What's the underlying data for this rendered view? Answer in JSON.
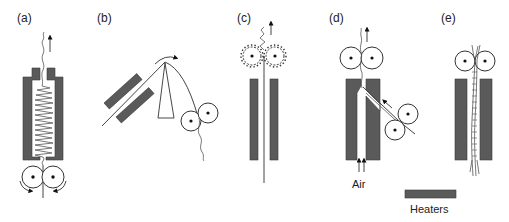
{
  "figure": {
    "panels": [
      {
        "id": "a",
        "label": "(a)"
      },
      {
        "id": "b",
        "label": "(b)"
      },
      {
        "id": "c",
        "label": "(c)"
      },
      {
        "id": "d",
        "label": "(d)"
      },
      {
        "id": "e",
        "label": "(e)"
      }
    ],
    "annotations": {
      "air": "Air"
    },
    "legend": {
      "heaters": "Heaters"
    },
    "colors": {
      "heater": "#5a5a5a",
      "line": "#444444",
      "background": "#ffffff"
    }
  }
}
